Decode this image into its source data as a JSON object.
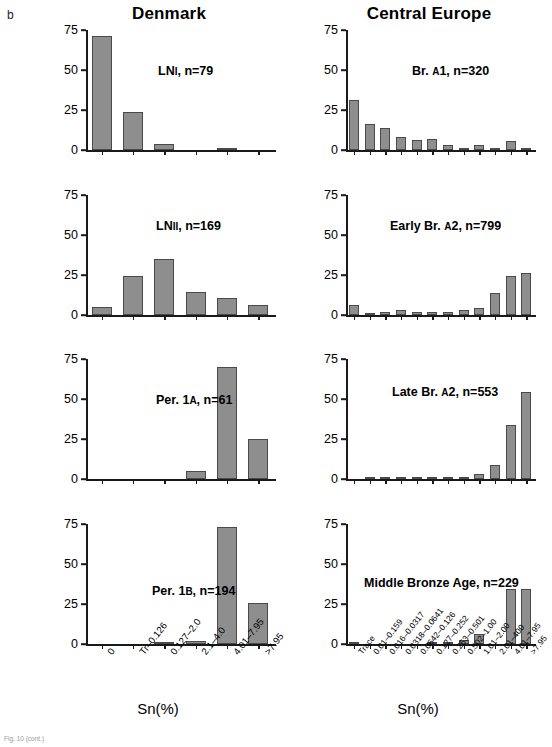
{
  "figure": {
    "panel_letter": "b",
    "caption": "Fig. 10 (cont.)",
    "columns": [
      {
        "key": "denmark",
        "title": "Denmark"
      },
      {
        "key": "central_europe",
        "title": "Central Europe"
      }
    ],
    "axis_title": "Sn(%)",
    "y_ticks": [
      "0",
      "25",
      "50",
      "75"
    ]
  },
  "chart_data": [
    {
      "type": "bar",
      "id": "denmark-ln1",
      "title": "LN I, n=79",
      "title_main": "LN",
      "title_smallcaps": "I",
      "title_tail": ", n=79",
      "region": "Denmark",
      "categories": [
        "0",
        "Tr–0.126",
        "0.127–2.0",
        "2.1–4.0",
        "4.01–7.95",
        ">7.95"
      ],
      "values": [
        71,
        24,
        3.5,
        0,
        0.7,
        0
      ],
      "xlabel": "Sn(%)",
      "ylabel": "",
      "ylim": [
        0,
        75
      ],
      "yticks": [
        0,
        25,
        50,
        75
      ],
      "grid": false,
      "legend": "none"
    },
    {
      "type": "bar",
      "id": "denmark-ln2",
      "title": "LN II, n=169",
      "title_main": "LN",
      "title_smallcaps": "II",
      "title_tail": ", n=169",
      "region": "Denmark",
      "categories": [
        "0",
        "Tr–0.126",
        "0.127–2.0",
        "2.1–4.0",
        "4.01–7.95",
        ">7.95"
      ],
      "values": [
        5,
        24.5,
        35,
        14.5,
        10.5,
        6
      ],
      "xlabel": "Sn(%)",
      "ylabel": "",
      "ylim": [
        0,
        75
      ],
      "yticks": [
        0,
        25,
        50,
        75
      ],
      "grid": false,
      "legend": "none"
    },
    {
      "type": "bar",
      "id": "denmark-per1a",
      "title": "Per. 1A, n=61",
      "title_main": "Per. 1",
      "title_smallcaps": "A",
      "title_tail": ", n=61",
      "region": "Denmark",
      "categories": [
        "0",
        "Tr–0.126",
        "0.127–2.0",
        "2.1–4.0",
        "4.01–7.95",
        ">7.95"
      ],
      "values": [
        0,
        0,
        0,
        5,
        70,
        25
      ],
      "xlabel": "Sn(%)",
      "ylabel": "",
      "ylim": [
        0,
        75
      ],
      "yticks": [
        0,
        25,
        50,
        75
      ],
      "grid": false,
      "legend": "none"
    },
    {
      "type": "bar",
      "id": "denmark-per1b",
      "title": "Per. 1B, n=194",
      "title_main": "Per. 1",
      "title_smallcaps": "B",
      "title_tail": ", n=194",
      "region": "Denmark",
      "categories": [
        "0",
        "Tr–0.126",
        "0.127–2.0",
        "2.1–4.0",
        "4.01–7.95",
        ">7.95"
      ],
      "values": [
        0,
        0,
        1,
        2,
        73,
        25.5
      ],
      "xlabel": "Sn(%)",
      "ylabel": "",
      "ylim": [
        0,
        75
      ],
      "yticks": [
        0,
        25,
        50,
        75
      ],
      "grid": false,
      "legend": "none"
    },
    {
      "type": "bar",
      "id": "ce-br-a1",
      "title": "Br. A1, n=320",
      "title_main": "Br. ",
      "title_smallcaps": "A",
      "title_tail": "1, n=320",
      "region": "Central Europe",
      "categories": [
        "Trace",
        "0.01–0.159",
        "0.016–0.0317",
        "0.0318–0.0641",
        "0.0642–0.126",
        "0.127–0.252",
        "0.253–0.501",
        "0.502–1.00",
        "1.01–2.00",
        "2.01–400",
        "4.01–7.95",
        ">7.95"
      ],
      "values": [
        31,
        16.5,
        14,
        8,
        6,
        7,
        3,
        1.5,
        3,
        1.5,
        5.5,
        1.5
      ],
      "xlabel": "Sn(%)",
      "ylabel": "",
      "ylim": [
        0,
        75
      ],
      "yticks": [
        0,
        25,
        50,
        75
      ],
      "grid": false,
      "legend": "none"
    },
    {
      "type": "bar",
      "id": "ce-early-br-a2",
      "title": "Early Br. A2, n=799",
      "title_main": "Early Br. ",
      "title_smallcaps": "A",
      "title_tail": "2, n=799",
      "region": "Central Europe",
      "categories": [
        "Trace",
        "0.01–0.159",
        "0.016–0.0317",
        "0.0318–0.0641",
        "0.0642–0.126",
        "0.127–0.252",
        "0.253–0.501",
        "0.502–1.00",
        "1.01–2.00",
        "2.01–400",
        "4.01–7.95",
        ">7.95"
      ],
      "values": [
        6.5,
        1,
        2,
        3,
        2,
        2,
        2,
        3,
        4.5,
        14,
        24.5,
        26
      ],
      "xlabel": "Sn(%)",
      "ylabel": "",
      "ylim": [
        0,
        75
      ],
      "yticks": [
        0,
        25,
        50,
        75
      ],
      "grid": false,
      "legend": "none"
    },
    {
      "type": "bar",
      "id": "ce-late-br-a2",
      "title": "Late Br. A2, n=553",
      "title_main": "Late Br. ",
      "title_smallcaps": "A",
      "title_tail": "2, n=553",
      "region": "Central Europe",
      "categories": [
        "Trace",
        "0.01–0.159",
        "0.016–0.0317",
        "0.0318–0.0641",
        "0.0642–0.126",
        "0.127–0.252",
        "0.253–0.501",
        "0.502–1.00",
        "1.01–2.00",
        "2.01–400",
        "4.01–7.95",
        ">7.95"
      ],
      "values": [
        0,
        1,
        1,
        0.5,
        1,
        0.5,
        1,
        1.5,
        3,
        8.5,
        34,
        54.5
      ],
      "xlabel": "Sn(%)",
      "ylabel": "",
      "ylim": [
        0,
        75
      ],
      "yticks": [
        0,
        25,
        50,
        75
      ],
      "grid": false,
      "legend": "none"
    },
    {
      "type": "bar",
      "id": "ce-middle-bronze-age",
      "title": "Middle Bronze Age, n=229",
      "title_main": "Middle Bronze Age",
      "title_smallcaps": "",
      "title_tail": ", n=229",
      "region": "Central Europe",
      "categories": [
        "Trace",
        "0.01–0.159",
        "0.016–0.0317",
        "0.0318–0.0641",
        "0.0642–0.126",
        "0.127–0.252",
        "0.253–0.501",
        "0.502–1.00",
        "1.01–2.00",
        "2.01–400",
        "4.01–7.95",
        ">7.95"
      ],
      "values": [
        0.7,
        0,
        0,
        0,
        0,
        0.7,
        0.7,
        2.5,
        6,
        0,
        34.5,
        34.5
      ],
      "xlabel": "Sn(%)",
      "ylabel": "",
      "ylim": [
        0,
        75
      ],
      "yticks": [
        0,
        25,
        50,
        75
      ],
      "grid": false,
      "legend": "none"
    }
  ],
  "panel_label_positions": [
    {
      "id": "denmark-ln1",
      "left": 110,
      "top": 40
    },
    {
      "id": "denmark-ln2",
      "left": 108,
      "top": 30
    },
    {
      "id": "denmark-per1a",
      "left": 108,
      "top": 40
    },
    {
      "id": "denmark-per1b",
      "left": 104,
      "top": 66
    },
    {
      "id": "ce-br-a1",
      "left": 104,
      "top": 40
    },
    {
      "id": "ce-early-br-a2",
      "left": 82,
      "top": 30
    },
    {
      "id": "ce-late-br-a2",
      "left": 84,
      "top": 32
    },
    {
      "id": "ce-middle-bronze-age",
      "left": 56,
      "top": 58
    }
  ],
  "colors": {
    "bar_fill": "#8e8e8e",
    "bar_edge": "#4a4a4a",
    "axis": "#1a1a1a",
    "text": "#000000",
    "background": "#ffffff"
  }
}
